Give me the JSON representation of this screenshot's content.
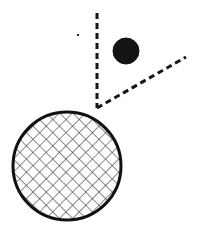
{
  "canvas": {
    "width": 197,
    "height": 233,
    "background_color": "#ffffff",
    "stroke_color": "#1a1a1a"
  },
  "figure": {
    "title": "Geometric line drawing: angle with dashed rays, filled dot, and hatched circle",
    "kind": "line-art-diagram"
  },
  "shapes": {
    "vertical_dashed_ray": {
      "label": "vertical dashed ray",
      "x1": 97,
      "y1": 13,
      "x2": 97,
      "y2": 108,
      "stroke_width": 3,
      "dash_on": 6,
      "dash_off": 4,
      "color": "#151515"
    },
    "diagonal_dashed_ray": {
      "label": "diagonal dashed ray",
      "x1": 97,
      "y1": 108,
      "x2": 186,
      "y2": 57,
      "stroke_width": 3,
      "dash_on": 6,
      "dash_off": 4,
      "color": "#151515"
    },
    "vertex": {
      "label": "angle vertex",
      "cx": 97,
      "cy": 108
    },
    "filled_circle": {
      "label": "small solid black circle",
      "cx": 126,
      "cy": 51,
      "r": 13,
      "fill": "#141414",
      "stroke": "#141414",
      "stroke_width": 1
    },
    "tiny_dot": {
      "label": "tiny stray dot",
      "cx": 78,
      "cy": 35,
      "r": 1.2,
      "fill": "#2a2a2a"
    },
    "hatched_circle": {
      "label": "large cross-hatched circle",
      "cx": 67,
      "cy": 166,
      "r": 54,
      "outline_color": "#111111",
      "outline_width": 3,
      "fill": "#ffffff",
      "hatch": {
        "style": "cross-hatch",
        "angle_deg": 45,
        "spacing": 6.6,
        "line_width": 1.1,
        "color": "#2e2e2e"
      }
    }
  }
}
